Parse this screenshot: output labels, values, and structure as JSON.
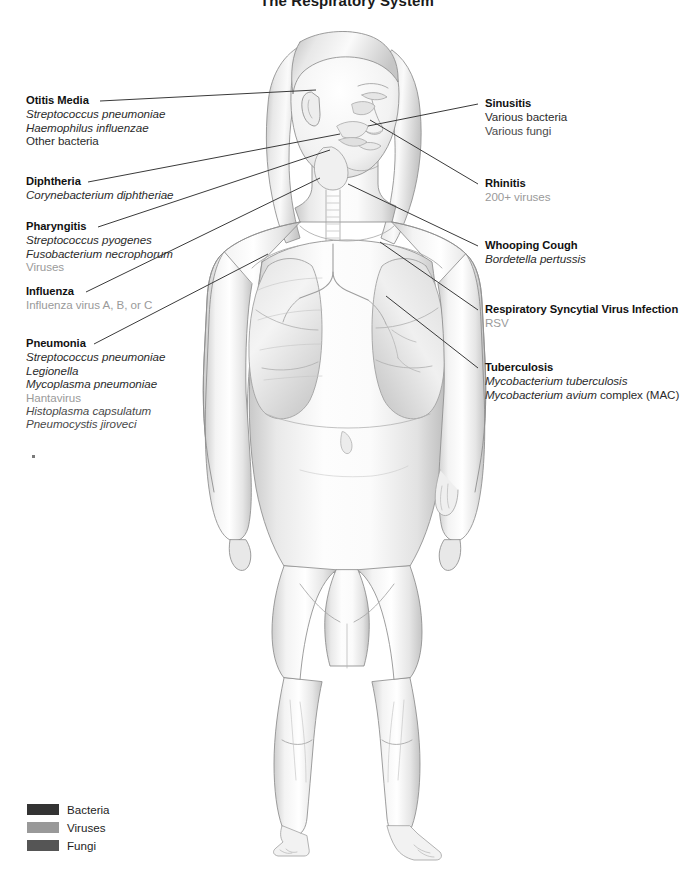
{
  "title": "The Respiratory System",
  "figure": {
    "alt_name": "human-body-respiratory-illustration"
  },
  "labels_left": [
    {
      "id": "otitis-media",
      "title": "Otitis Media",
      "items": [
        {
          "text": "Streptococcus pneumoniae",
          "kind": "bacteria",
          "italic": true
        },
        {
          "text": "Haemophilus influenzae",
          "kind": "bacteria",
          "italic": true
        },
        {
          "text": "Other bacteria",
          "kind": "bacteria",
          "italic": false
        }
      ]
    },
    {
      "id": "diphtheria",
      "title": "Diphtheria",
      "items": [
        {
          "text": "Corynebacterium diphtheriae",
          "kind": "bacteria",
          "italic": true
        }
      ]
    },
    {
      "id": "pharyngitis",
      "title": "Pharyngitis",
      "items": [
        {
          "text": "Streptococcus pyogenes",
          "kind": "bacteria",
          "italic": true
        },
        {
          "text": "Fusobacterium necrophorum",
          "kind": "bacteria",
          "italic": true
        },
        {
          "text": "Viruses",
          "kind": "virus",
          "italic": false
        }
      ]
    },
    {
      "id": "influenza",
      "title": "Influenza",
      "items": [
        {
          "text": "Influenza virus A, B, or C",
          "kind": "virus",
          "italic": false
        }
      ]
    },
    {
      "id": "pneumonia",
      "title": "Pneumonia",
      "items": [
        {
          "text": "Streptococcus pneumoniae",
          "kind": "bacteria",
          "italic": true
        },
        {
          "text": "Legionella",
          "kind": "bacteria",
          "italic": true
        },
        {
          "text": "Mycoplasma pneumoniae",
          "kind": "bacteria",
          "italic": true
        },
        {
          "text": "Hantavirus",
          "kind": "virus",
          "italic": false
        },
        {
          "text": "Histoplasma capsulatum",
          "kind": "fungi",
          "italic": true
        },
        {
          "text": "Pneumocystis jiroveci",
          "kind": "fungi",
          "italic": true
        }
      ]
    }
  ],
  "labels_right": [
    {
      "id": "sinusitis",
      "title": "Sinusitis",
      "items": [
        {
          "text": "Various bacteria",
          "kind": "bacteria",
          "italic": false
        },
        {
          "text": "Various fungi",
          "kind": "fungi",
          "italic": false
        }
      ]
    },
    {
      "id": "rhinitis",
      "title": "Rhinitis",
      "items": [
        {
          "text": "200+ viruses",
          "kind": "virus",
          "italic": false
        }
      ]
    },
    {
      "id": "whooping-cough",
      "title": "Whooping Cough",
      "items": [
        {
          "text": "Bordetella pertussis",
          "kind": "bacteria",
          "italic": true
        }
      ]
    },
    {
      "id": "rsv-infection",
      "title": "Respiratory Syncytial Virus Infection",
      "items": [
        {
          "text": "RSV",
          "kind": "virus",
          "italic": false
        }
      ]
    },
    {
      "id": "tuberculosis",
      "title": "Tuberculosis",
      "items": [
        {
          "text": "Mycobacterium tuberculosis",
          "kind": "bacteria",
          "italic": true
        },
        {
          "text": "Mycobacterium avium",
          "suffix": " complex (MAC)",
          "kind": "bacteria",
          "italic": true
        }
      ]
    }
  ],
  "legend": {
    "rows": [
      {
        "label": "Bacteria",
        "color": "#333333"
      },
      {
        "label": "Viruses",
        "color": "#999999"
      },
      {
        "label": "Fungi",
        "color": "#555555"
      }
    ]
  },
  "colors": {
    "bacteria_text": "#2b2b2b",
    "virus_text": "#9a9a9a",
    "fungi_text": "#4a4a4a",
    "leader_line": "#3a3a3a",
    "title_text": "#1a1a1a"
  }
}
